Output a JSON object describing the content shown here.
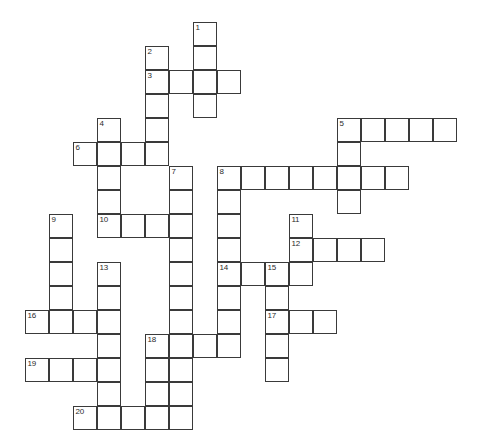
{
  "puzzle": {
    "type": "crossword-grid",
    "title": "",
    "background_color": "#ffffff",
    "cell_border_color": "#3a3a3a",
    "cell_fill_color": "#ffffff",
    "number_color": "#2b2b2b",
    "cell_size_px": 24,
    "origin_x_px": 25,
    "origin_y_px": 22,
    "columns": 18,
    "rows": 17,
    "entries": [
      {
        "number": "1",
        "direction": "down",
        "row": 0,
        "col": 7,
        "length": 5
      },
      {
        "number": "2",
        "direction": "down",
        "row": 1,
        "col": 5,
        "length": 5
      },
      {
        "number": "3",
        "direction": "across",
        "row": 2,
        "col": 5,
        "length": 4
      },
      {
        "number": "4",
        "direction": "down",
        "row": 4,
        "col": 3,
        "length": 6
      },
      {
        "number": "5",
        "direction": "across",
        "row": 4,
        "col": 13,
        "length": 5
      },
      {
        "number": "5",
        "direction": "down",
        "row": 4,
        "col": 13,
        "length": 5
      },
      {
        "number": "6",
        "direction": "across",
        "row": 5,
        "col": 2,
        "length": 4
      },
      {
        "number": "7",
        "direction": "down",
        "row": 6,
        "col": 6,
        "length": 9
      },
      {
        "number": "8",
        "direction": "across",
        "row": 6,
        "col": 8,
        "length": 8
      },
      {
        "number": "8",
        "direction": "down",
        "row": 6,
        "col": 8,
        "length": 9
      },
      {
        "number": "9",
        "direction": "down",
        "row": 8,
        "col": 1,
        "length": 5
      },
      {
        "number": "10",
        "direction": "across",
        "row": 8,
        "col": 3,
        "length": 4
      },
      {
        "number": "11",
        "direction": "down",
        "row": 8,
        "col": 11,
        "length": 3
      },
      {
        "number": "12",
        "direction": "across",
        "row": 9,
        "col": 11,
        "length": 4
      },
      {
        "number": "13",
        "direction": "down",
        "row": 10,
        "col": 3,
        "length": 7
      },
      {
        "number": "14",
        "direction": "across",
        "row": 10,
        "col": 8,
        "length": 4
      },
      {
        "number": "15",
        "direction": "down",
        "row": 10,
        "col": 10,
        "length": 5
      },
      {
        "number": "16",
        "direction": "across",
        "row": 12,
        "col": 0,
        "length": 4
      },
      {
        "number": "17",
        "direction": "across",
        "row": 12,
        "col": 10,
        "length": 3
      },
      {
        "number": "18",
        "direction": "across",
        "row": 13,
        "col": 5,
        "length": 4
      },
      {
        "number": "18",
        "direction": "down",
        "row": 13,
        "col": 5,
        "length": 4
      },
      {
        "number": "19",
        "direction": "across",
        "row": 14,
        "col": 0,
        "length": 4
      },
      {
        "number": "20",
        "direction": "across",
        "row": 16,
        "col": 2,
        "length": 4
      }
    ],
    "cells": [
      {
        "row": 0,
        "col": 7,
        "number": "1"
      },
      {
        "row": 1,
        "col": 5,
        "number": "2"
      },
      {
        "row": 1,
        "col": 7,
        "number": ""
      },
      {
        "row": 2,
        "col": 5,
        "number": "3"
      },
      {
        "row": 2,
        "col": 6,
        "number": ""
      },
      {
        "row": 2,
        "col": 7,
        "number": ""
      },
      {
        "row": 2,
        "col": 8,
        "number": ""
      },
      {
        "row": 3,
        "col": 5,
        "number": ""
      },
      {
        "row": 3,
        "col": 7,
        "number": ""
      },
      {
        "row": 4,
        "col": 3,
        "number": "4"
      },
      {
        "row": 4,
        "col": 5,
        "number": ""
      },
      {
        "row": 4,
        "col": 13,
        "number": "5"
      },
      {
        "row": 4,
        "col": 14,
        "number": ""
      },
      {
        "row": 4,
        "col": 15,
        "number": ""
      },
      {
        "row": 4,
        "col": 16,
        "number": ""
      },
      {
        "row": 4,
        "col": 17,
        "number": ""
      },
      {
        "row": 5,
        "col": 2,
        "number": "6"
      },
      {
        "row": 5,
        "col": 3,
        "number": ""
      },
      {
        "row": 5,
        "col": 4,
        "number": ""
      },
      {
        "row": 5,
        "col": 5,
        "number": ""
      },
      {
        "row": 5,
        "col": 13,
        "number": ""
      },
      {
        "row": 6,
        "col": 3,
        "number": ""
      },
      {
        "row": 6,
        "col": 6,
        "number": "7"
      },
      {
        "row": 6,
        "col": 8,
        "number": "8"
      },
      {
        "row": 6,
        "col": 9,
        "number": ""
      },
      {
        "row": 6,
        "col": 10,
        "number": ""
      },
      {
        "row": 6,
        "col": 11,
        "number": ""
      },
      {
        "row": 6,
        "col": 12,
        "number": ""
      },
      {
        "row": 6,
        "col": 13,
        "number": ""
      },
      {
        "row": 6,
        "col": 14,
        "number": ""
      },
      {
        "row": 6,
        "col": 15,
        "number": ""
      },
      {
        "row": 7,
        "col": 3,
        "number": ""
      },
      {
        "row": 7,
        "col": 6,
        "number": ""
      },
      {
        "row": 7,
        "col": 8,
        "number": ""
      },
      {
        "row": 7,
        "col": 13,
        "number": ""
      },
      {
        "row": 8,
        "col": 1,
        "number": "9"
      },
      {
        "row": 8,
        "col": 3,
        "number": "10"
      },
      {
        "row": 8,
        "col": 4,
        "number": ""
      },
      {
        "row": 8,
        "col": 5,
        "number": ""
      },
      {
        "row": 8,
        "col": 6,
        "number": ""
      },
      {
        "row": 8,
        "col": 8,
        "number": ""
      },
      {
        "row": 8,
        "col": 11,
        "number": "11"
      },
      {
        "row": 9,
        "col": 1,
        "number": ""
      },
      {
        "row": 9,
        "col": 6,
        "number": ""
      },
      {
        "row": 9,
        "col": 8,
        "number": ""
      },
      {
        "row": 9,
        "col": 11,
        "number": "12"
      },
      {
        "row": 9,
        "col": 12,
        "number": ""
      },
      {
        "row": 9,
        "col": 13,
        "number": ""
      },
      {
        "row": 9,
        "col": 14,
        "number": ""
      },
      {
        "row": 10,
        "col": 1,
        "number": ""
      },
      {
        "row": 10,
        "col": 3,
        "number": "13"
      },
      {
        "row": 10,
        "col": 6,
        "number": ""
      },
      {
        "row": 10,
        "col": 8,
        "number": "14"
      },
      {
        "row": 10,
        "col": 9,
        "number": ""
      },
      {
        "row": 10,
        "col": 10,
        "number": "15"
      },
      {
        "row": 10,
        "col": 11,
        "number": ""
      },
      {
        "row": 11,
        "col": 1,
        "number": ""
      },
      {
        "row": 11,
        "col": 3,
        "number": ""
      },
      {
        "row": 11,
        "col": 6,
        "number": ""
      },
      {
        "row": 11,
        "col": 8,
        "number": ""
      },
      {
        "row": 11,
        "col": 10,
        "number": ""
      },
      {
        "row": 12,
        "col": 0,
        "number": "16"
      },
      {
        "row": 12,
        "col": 1,
        "number": ""
      },
      {
        "row": 12,
        "col": 2,
        "number": ""
      },
      {
        "row": 12,
        "col": 3,
        "number": ""
      },
      {
        "row": 12,
        "col": 6,
        "number": ""
      },
      {
        "row": 12,
        "col": 8,
        "number": ""
      },
      {
        "row": 12,
        "col": 10,
        "number": "17"
      },
      {
        "row": 12,
        "col": 11,
        "number": ""
      },
      {
        "row": 12,
        "col": 12,
        "number": ""
      },
      {
        "row": 13,
        "col": 3,
        "number": ""
      },
      {
        "row": 13,
        "col": 5,
        "number": "18"
      },
      {
        "row": 13,
        "col": 6,
        "number": ""
      },
      {
        "row": 13,
        "col": 7,
        "number": ""
      },
      {
        "row": 13,
        "col": 8,
        "number": ""
      },
      {
        "row": 13,
        "col": 10,
        "number": ""
      },
      {
        "row": 14,
        "col": 0,
        "number": "19"
      },
      {
        "row": 14,
        "col": 1,
        "number": ""
      },
      {
        "row": 14,
        "col": 2,
        "number": ""
      },
      {
        "row": 14,
        "col": 3,
        "number": ""
      },
      {
        "row": 14,
        "col": 5,
        "number": ""
      },
      {
        "row": 14,
        "col": 6,
        "number": ""
      },
      {
        "row": 14,
        "col": 10,
        "number": ""
      },
      {
        "row": 15,
        "col": 3,
        "number": ""
      },
      {
        "row": 15,
        "col": 5,
        "number": ""
      },
      {
        "row": 15,
        "col": 6,
        "number": ""
      },
      {
        "row": 16,
        "col": 2,
        "number": "20"
      },
      {
        "row": 16,
        "col": 3,
        "number": ""
      },
      {
        "row": 16,
        "col": 4,
        "number": ""
      },
      {
        "row": 16,
        "col": 5,
        "number": ""
      },
      {
        "row": 16,
        "col": 6,
        "number": ""
      }
    ]
  }
}
